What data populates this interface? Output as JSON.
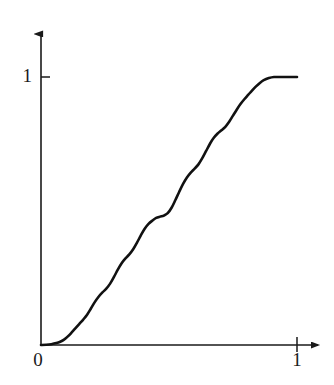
{
  "chart_data": {
    "type": "line",
    "title": "",
    "subtitle": "",
    "xlabel": "",
    "ylabel": "",
    "xlim": [
      0,
      1.07
    ],
    "ylim": [
      0,
      1.09
    ],
    "grid": false,
    "legend": null,
    "x_ticks": [
      {
        "value": 0,
        "label": "0"
      },
      {
        "value": 1,
        "label": "1"
      }
    ],
    "y_ticks": [
      {
        "value": 1,
        "label": "1"
      }
    ],
    "axis_style": {
      "x_axis_arrow": true,
      "y_axis_arrow": true,
      "color": "#1a1a1a",
      "line_width": 1.6
    },
    "series": [
      {
        "name": "cdf",
        "color": "#111111",
        "line_width": 2.6,
        "x": [
          0.0,
          0.02,
          0.04,
          0.06,
          0.075,
          0.09,
          0.105,
          0.12,
          0.135,
          0.15,
          0.165,
          0.18,
          0.195,
          0.21,
          0.225,
          0.24,
          0.255,
          0.27,
          0.285,
          0.3,
          0.315,
          0.33,
          0.345,
          0.36,
          0.375,
          0.39,
          0.405,
          0.42,
          0.435,
          0.45,
          0.465,
          0.48,
          0.495,
          0.51,
          0.525,
          0.54,
          0.555,
          0.57,
          0.585,
          0.6,
          0.615,
          0.63,
          0.645,
          0.66,
          0.675,
          0.69,
          0.705,
          0.72,
          0.735,
          0.75,
          0.765,
          0.78,
          0.795,
          0.81,
          0.825,
          0.84,
          0.855,
          0.87,
          0.89,
          0.91,
          0.94,
          0.97,
          1.0
        ],
        "y": [
          0.0,
          0.001,
          0.003,
          0.007,
          0.012,
          0.02,
          0.032,
          0.047,
          0.063,
          0.079,
          0.095,
          0.113,
          0.136,
          0.16,
          0.18,
          0.196,
          0.21,
          0.229,
          0.254,
          0.281,
          0.305,
          0.323,
          0.338,
          0.357,
          0.382,
          0.409,
          0.434,
          0.452,
          0.464,
          0.474,
          0.479,
          0.483,
          0.492,
          0.512,
          0.541,
          0.572,
          0.601,
          0.625,
          0.643,
          0.658,
          0.674,
          0.697,
          0.724,
          0.751,
          0.773,
          0.789,
          0.801,
          0.814,
          0.833,
          0.856,
          0.879,
          0.9,
          0.918,
          0.934,
          0.95,
          0.965,
          0.978,
          0.988,
          0.996,
          1.0,
          1.0,
          1.0,
          1.0
        ]
      }
    ]
  },
  "labels": {
    "y_one": "1",
    "x_zero": "0",
    "x_one": "1"
  }
}
